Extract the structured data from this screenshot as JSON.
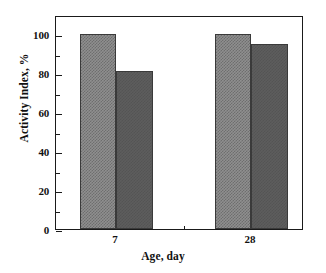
{
  "chart_data": {
    "type": "bar",
    "title": "",
    "subtitle": "",
    "xlabel": "Age, day",
    "ylabel": "Activity Index, %",
    "categories": [
      "7",
      "28"
    ],
    "series": [
      {
        "name": "series-1",
        "values": [
          100,
          100
        ],
        "fill": "checkerboard",
        "color": "#8f8f8f"
      },
      {
        "name": "series-2",
        "values": [
          81,
          95
        ],
        "fill": "solid-gray",
        "color": "#5d5d5d"
      }
    ],
    "ylim": [
      0,
      110
    ],
    "ytick_labels": [
      "0",
      "20",
      "40",
      "60",
      "80",
      "100"
    ],
    "ytick_values": [
      0,
      20,
      40,
      60,
      80,
      100
    ],
    "yminor_values": [
      10,
      30,
      50,
      70,
      90
    ],
    "xtick_labels": [
      "7",
      "28"
    ],
    "grid": false,
    "legend": "none",
    "frame": "box",
    "annotations": []
  },
  "axes": {
    "y_title": "Activity Index, %",
    "x_title": "Age, day"
  }
}
